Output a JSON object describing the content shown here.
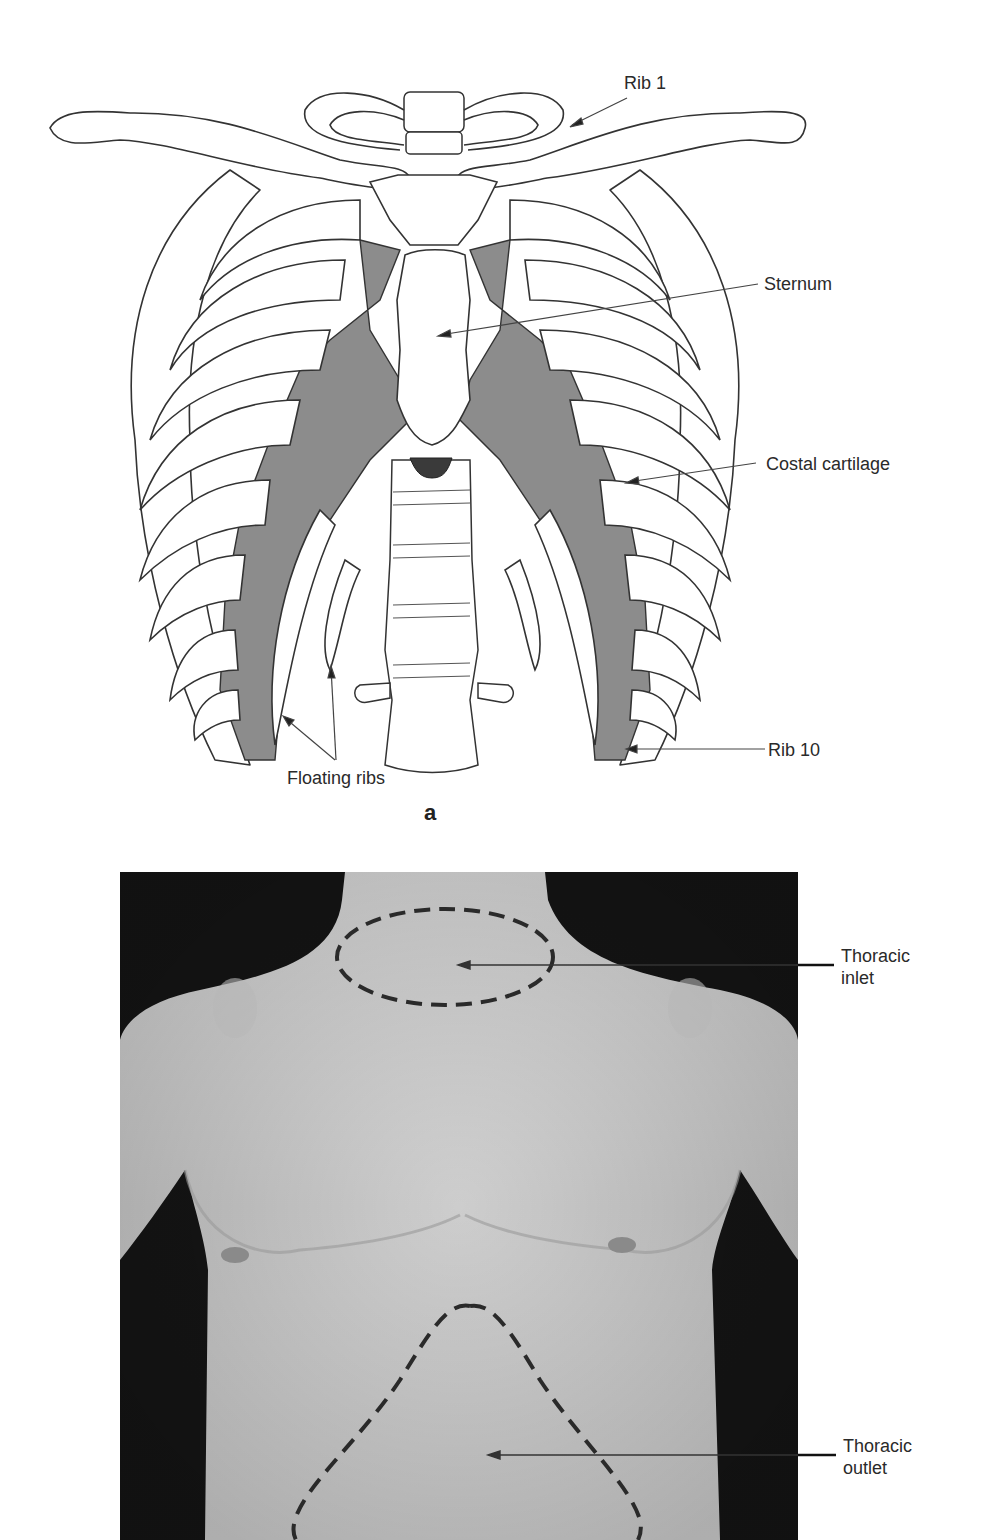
{
  "figure": {
    "panel_a": {
      "letter": "a",
      "labels": {
        "rib1": "Rib 1",
        "sternum": "Sternum",
        "costal_cartilage": "Costal cartilage",
        "rib10": "Rib 10",
        "floating_ribs": "Floating ribs"
      },
      "colors": {
        "bone_fill": "#ffffff",
        "outline": "#333333",
        "cartilage": "#8c8c8c",
        "xiphoid": "#3a3a3a"
      }
    },
    "panel_b": {
      "labels": {
        "inlet_line1": "Thoracic",
        "inlet_line2": "inlet",
        "outlet_line1": "Thoracic",
        "outlet_line2": "outlet"
      },
      "colors": {
        "background": "#151515",
        "skin": "#cfcfcf",
        "dash": "#2a2a2a"
      }
    }
  }
}
